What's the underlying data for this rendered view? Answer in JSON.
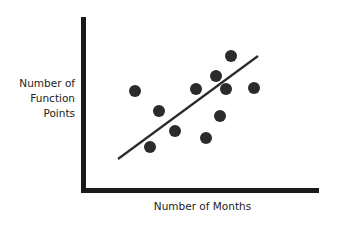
{
  "chart_data": {
    "type": "scatter",
    "title": "",
    "xlabel": "Number of Months",
    "ylabel_lines": [
      "Number of",
      "Function",
      "Points"
    ],
    "ylabel": "Number of Function Points",
    "grid": false,
    "legend": null,
    "tick_labels": false,
    "points": [
      {
        "x": 135,
        "y": 91
      },
      {
        "x": 159,
        "y": 111
      },
      {
        "x": 150,
        "y": 147
      },
      {
        "x": 175,
        "y": 131
      },
      {
        "x": 196,
        "y": 89
      },
      {
        "x": 206,
        "y": 138
      },
      {
        "x": 216,
        "y": 76
      },
      {
        "x": 231,
        "y": 56
      },
      {
        "x": 226,
        "y": 89
      },
      {
        "x": 220,
        "y": 116
      },
      {
        "x": 254,
        "y": 88
      }
    ],
    "trend_line": {
      "x1": 118,
      "y1": 159,
      "x2": 258,
      "y2": 56
    },
    "point_radius": 6,
    "colors": {
      "points": "#2b2b2b",
      "line": "#2b2b2b",
      "axes": "#1a1a1a"
    }
  }
}
